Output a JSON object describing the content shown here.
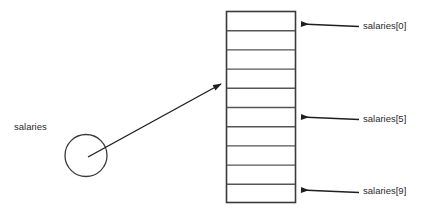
{
  "diagram": {
    "type": "array-memory-diagram",
    "colors": {
      "background": "#ffffff",
      "stroke": "#3a3a3a",
      "cell_border": "#555555",
      "text": "#2b2b2b",
      "arrow": "#1f1f1f"
    },
    "pointer": {
      "label": "salaries",
      "shape": "circle",
      "circle": {
        "cx": 86,
        "cy": 155,
        "r": 21
      },
      "label_position": {
        "x": 14,
        "y": 122
      }
    },
    "pointer_arrow": {
      "name": "reference-arrow",
      "from": {
        "x": 88,
        "y": 157
      },
      "to": {
        "x": 223,
        "y": 83
      },
      "direction": "up-right"
    },
    "array_box": {
      "name": "array-cells",
      "x": 226,
      "y": 11,
      "width": 70,
      "height": 192,
      "cell_count": 10,
      "cell_height": 19.2,
      "cells": [
        {
          "index": 0,
          "value": ""
        },
        {
          "index": 1,
          "value": ""
        },
        {
          "index": 2,
          "value": ""
        },
        {
          "index": 3,
          "value": ""
        },
        {
          "index": 4,
          "value": ""
        },
        {
          "index": 5,
          "value": ""
        },
        {
          "index": 6,
          "value": ""
        },
        {
          "index": 7,
          "value": ""
        },
        {
          "index": 8,
          "value": ""
        },
        {
          "index": 9,
          "value": ""
        }
      ]
    },
    "index_labels": [
      {
        "id": "index-0",
        "text": "salaries[0]",
        "cell_index": 0,
        "arrow": {
          "tip_x": 300,
          "tail_x": 359,
          "y": 24
        },
        "position": {
          "x": 363,
          "y": 21
        }
      },
      {
        "id": "index-5",
        "text": "salaries[5]",
        "cell_index": 5,
        "arrow": {
          "tip_x": 300,
          "tail_x": 359,
          "y": 117
        },
        "position": {
          "x": 363,
          "y": 114
        }
      },
      {
        "id": "index-9",
        "text": "salaries[9]",
        "cell_index": 9,
        "arrow": {
          "tip_x": 300,
          "tail_x": 359,
          "y": 190
        },
        "position": {
          "x": 363,
          "y": 186
        }
      }
    ]
  }
}
